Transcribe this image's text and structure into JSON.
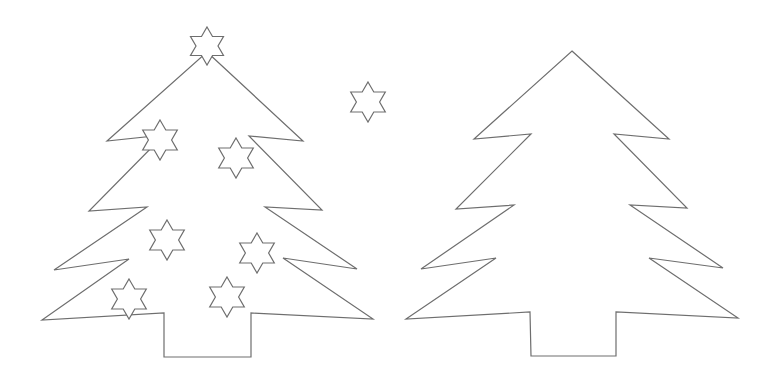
{
  "canvas": {
    "width": 775,
    "height": 386,
    "background": "#ffffff",
    "stroke_color": "#6e6e6e"
  },
  "trees": [
    {
      "name": "decorated-tree",
      "points": [
        [
          207,
          52
        ],
        [
          303,
          141
        ],
        [
          249,
          136
        ],
        [
          322,
          210
        ],
        [
          265,
          207
        ],
        [
          357,
          269
        ],
        [
          283,
          258
        ],
        [
          373,
          319
        ],
        [
          251,
          313
        ],
        [
          251,
          357
        ],
        [
          164,
          357
        ],
        [
          164,
          313
        ],
        [
          42,
          320
        ],
        [
          129,
          259
        ],
        [
          54,
          270
        ],
        [
          147,
          207
        ],
        [
          89,
          211
        ],
        [
          164,
          135
        ],
        [
          107,
          141
        ]
      ],
      "stars": [
        {
          "cx": 207,
          "cy": 46,
          "r": 19
        },
        {
          "cx": 160,
          "cy": 140,
          "r": 20
        },
        {
          "cx": 236,
          "cy": 158,
          "r": 20
        },
        {
          "cx": 167,
          "cy": 240,
          "r": 20
        },
        {
          "cx": 257,
          "cy": 253,
          "r": 20
        },
        {
          "cx": 129,
          "cy": 299,
          "r": 20
        },
        {
          "cx": 227,
          "cy": 297,
          "r": 20
        }
      ]
    },
    {
      "name": "plain-tree",
      "points": [
        [
          572,
          51
        ],
        [
          669,
          139
        ],
        [
          614,
          134
        ],
        [
          687,
          208
        ],
        [
          630,
          205
        ],
        [
          723,
          268
        ],
        [
          649,
          258
        ],
        [
          738,
          318
        ],
        [
          616,
          312
        ],
        [
          616,
          356
        ],
        [
          531,
          356
        ],
        [
          530,
          312
        ],
        [
          406,
          319
        ],
        [
          496,
          258
        ],
        [
          421,
          269
        ],
        [
          514,
          205
        ],
        [
          456,
          209
        ],
        [
          531,
          134
        ],
        [
          474,
          139
        ]
      ],
      "stars": []
    }
  ],
  "loose_stars": [
    {
      "cx": 368,
      "cy": 102,
      "r": 20
    }
  ]
}
